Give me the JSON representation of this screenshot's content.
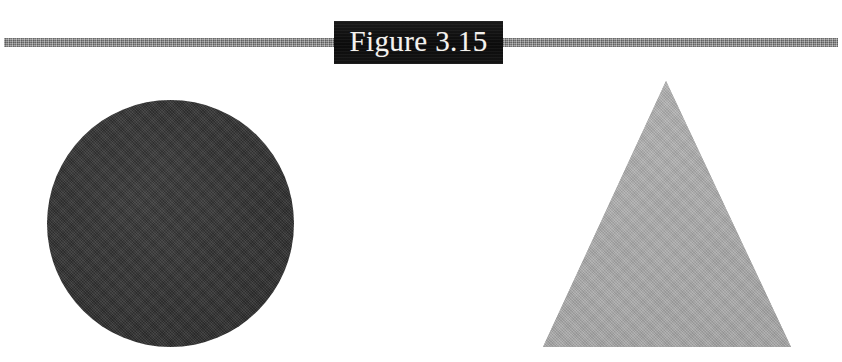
{
  "page": {
    "background_color": "#ffffff",
    "width": 842,
    "height": 362
  },
  "header": {
    "rule": {
      "name": "horizontal-rule",
      "color": "#8d8d8d",
      "texture": "mottled-gray-halftone"
    },
    "banner": {
      "title": "Figure 3.15",
      "background_color": "#111111",
      "text_color": "#f4f2ee"
    }
  },
  "figure": {
    "caption": "Figure 3.15",
    "shapes": [
      {
        "name": "circle",
        "label": "dark filled circle",
        "fill_color": "#353535",
        "texture": "halftone-screen",
        "center_x": 170,
        "center_y": 223,
        "diameter": 247
      },
      {
        "name": "triangle",
        "label": "gray filled equilateral triangle",
        "fill_color": "#a9a9a9",
        "texture": "halftone-screen",
        "apex_x": 666,
        "apex_y": 81,
        "base_left_x": 543,
        "base_right_x": 791,
        "base_y": 347
      }
    ]
  }
}
